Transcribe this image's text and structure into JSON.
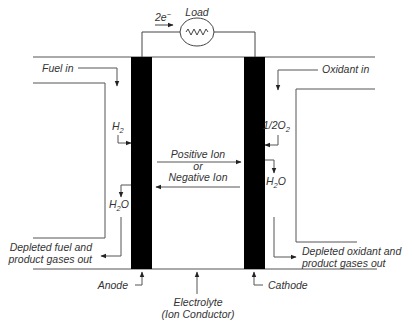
{
  "diagram": {
    "load": {
      "label": "Load",
      "electron_main": "2e",
      "electron_sup": "−"
    },
    "fuel_in": "Fuel in",
    "oxidant_in": "Oxidant in",
    "anode_reactant": {
      "main": "H",
      "sub": "2"
    },
    "anode_product": {
      "main": "H",
      "sub": "2",
      "tail": "O"
    },
    "cathode_reactant": {
      "main": "1/2O",
      "sub": "2"
    },
    "cathode_product": {
      "main": "H",
      "sub": "2",
      "tail": "O"
    },
    "ion_flow": {
      "positive": "Positive Ion",
      "or": "or",
      "negative": "Negative Ion"
    },
    "depleted_fuel": [
      "Depleted fuel and",
      "product gases out"
    ],
    "depleted_oxidant": [
      "Depleted oxidant and",
      "product gases out"
    ],
    "anode": "Anode",
    "cathode": "Cathode",
    "electrolyte": [
      "Electrolyte",
      "(Ion Conductor)"
    ],
    "colors": {
      "electrode": "#000000",
      "line": "#555555",
      "text": "#333333"
    }
  }
}
